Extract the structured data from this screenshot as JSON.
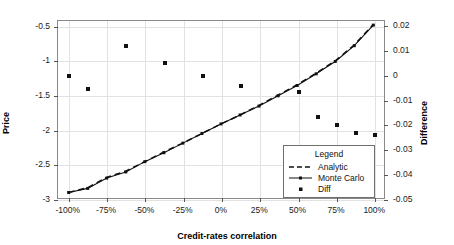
{
  "chart_data": {
    "type": "scatter",
    "title": "",
    "xlabel": "Credit-rates correlation",
    "ylabel": "Price",
    "y2label": "Difference",
    "xlim": [
      -100,
      100
    ],
    "ylim": [
      -3,
      -0.42
    ],
    "y2lim": [
      -0.05,
      0.022
    ],
    "grid": true,
    "legend_position": "bottom-right",
    "xticks": [
      -100,
      -75,
      -50,
      -25,
      0,
      25,
      50,
      75,
      100
    ],
    "xticklabels": [
      "-100%",
      "-75%",
      "-50%",
      "-25%",
      "0%",
      "25%",
      "50%",
      "75%",
      "100%"
    ],
    "yticks": [
      -0.5,
      -1,
      -1.5,
      -2,
      -2.5,
      -3
    ],
    "yticklabels": [
      "-0.5",
      "-1",
      "-1.5",
      "-2",
      "-2.5",
      "-3"
    ],
    "y2ticks": [
      0.02,
      0.01,
      0,
      -0.01,
      -0.02,
      -0.03,
      -0.04,
      -0.05
    ],
    "y2ticklabels": [
      "0.02",
      "0.01",
      "0",
      "-0.01",
      "-0.02",
      "-0.03",
      "-0.04",
      "-0.05"
    ],
    "series": [
      {
        "name": "Analytic",
        "axis": "left",
        "style": "dashed-line",
        "x": [
          -100,
          -87.5,
          -75,
          -62.5,
          -50,
          -37.5,
          -25,
          -12.5,
          0,
          12.5,
          25,
          37.5,
          50,
          62.5,
          75,
          87.5,
          100
        ],
        "values": [
          -2.92,
          -2.85,
          -2.7,
          -2.61,
          -2.47,
          -2.33,
          -2.2,
          -2.06,
          -1.92,
          -1.79,
          -1.65,
          -1.5,
          -1.35,
          -1.18,
          -1.0,
          -0.77,
          -0.47
        ]
      },
      {
        "name": "Monte Carlo",
        "axis": "left",
        "style": "line-with-markers",
        "x": [
          -100,
          -87.5,
          -75,
          -62.5,
          -50,
          -37.5,
          -25,
          -12.5,
          0,
          12.5,
          25,
          37.5,
          50,
          62.5,
          75,
          87.5,
          100
        ],
        "values": [
          -2.92,
          -2.86,
          -2.71,
          -2.62,
          -2.47,
          -2.34,
          -2.2,
          -2.06,
          -1.92,
          -1.79,
          -1.66,
          -1.51,
          -1.36,
          -1.19,
          -1.01,
          -0.78,
          -0.48
        ]
      },
      {
        "name": "Diff",
        "axis": "right",
        "style": "points",
        "x": [
          -100,
          -87.5,
          -62.5,
          -37.5,
          -12.5,
          12.5,
          50,
          62.5,
          75,
          87.5,
          100
        ],
        "values": [
          0.0,
          -0.0053,
          0.012,
          0.0051,
          0.0,
          -0.004,
          -0.0065,
          -0.0166,
          -0.02,
          -0.023,
          -0.0237
        ]
      }
    ]
  },
  "legend": {
    "title": "Legend",
    "entries": [
      {
        "label": "Analytic",
        "key": "dashed-line-key"
      },
      {
        "label": "Monte Carlo",
        "key": "line-marker-key"
      },
      {
        "label": "Diff",
        "key": "square-point-key"
      }
    ]
  }
}
